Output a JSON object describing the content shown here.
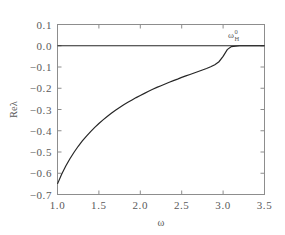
{
  "chart_data": {
    "type": "line",
    "title": "",
    "xlabel": "ω",
    "ylabel": "Reλ",
    "xlim": [
      1.0,
      3.5
    ],
    "ylim": [
      -0.7,
      0.1
    ],
    "grid": false,
    "legend": null,
    "xticks": [
      "1.0",
      "1.5",
      "2.0",
      "2.5",
      "3.0",
      "3.5"
    ],
    "xtick_values": [
      1.0,
      1.5,
      2.0,
      2.5,
      3.0,
      3.5
    ],
    "yticks": [
      "0.1",
      "0.0",
      "−0.1",
      "−0.2",
      "−0.3",
      "−0.4",
      "−0.5",
      "−0.6",
      "−0.7"
    ],
    "ytick_values": [
      0.1,
      0.0,
      -0.1,
      -0.2,
      -0.3,
      -0.4,
      -0.5,
      -0.6,
      -0.7
    ],
    "annotations": [
      {
        "text": "ω",
        "superscript": "0",
        "subscript": "H",
        "x": 3.07,
        "y": 0.055
      }
    ],
    "series": [
      {
        "name": "zero-line",
        "x": [
          1.0,
          3.5
        ],
        "values": [
          0.0,
          0.0
        ]
      },
      {
        "name": "Re-lambda-branch",
        "x": [
          1.0,
          1.05,
          1.1,
          1.15,
          1.2,
          1.25,
          1.3,
          1.35,
          1.4,
          1.45,
          1.5,
          1.55,
          1.6,
          1.65,
          1.7,
          1.75,
          1.8,
          1.85,
          1.9,
          1.95,
          2.0,
          2.05,
          2.1,
          2.15,
          2.2,
          2.25,
          2.3,
          2.35,
          2.4,
          2.45,
          2.5,
          2.55,
          2.6,
          2.65,
          2.7,
          2.75,
          2.8,
          2.85,
          2.9,
          2.95,
          3.0,
          3.05,
          3.1,
          3.2,
          3.3,
          3.4,
          3.5
        ],
        "values": [
          -0.65,
          -0.605,
          -0.566,
          -0.532,
          -0.501,
          -0.473,
          -0.448,
          -0.425,
          -0.404,
          -0.384,
          -0.366,
          -0.349,
          -0.333,
          -0.318,
          -0.304,
          -0.291,
          -0.278,
          -0.266,
          -0.255,
          -0.244,
          -0.234,
          -0.224,
          -0.214,
          -0.205,
          -0.196,
          -0.188,
          -0.18,
          -0.172,
          -0.164,
          -0.157,
          -0.149,
          -0.142,
          -0.135,
          -0.128,
          -0.121,
          -0.114,
          -0.107,
          -0.099,
          -0.089,
          -0.075,
          -0.05,
          -0.018,
          -0.004,
          0.0,
          0.0,
          0.0,
          0.0
        ]
      }
    ]
  }
}
